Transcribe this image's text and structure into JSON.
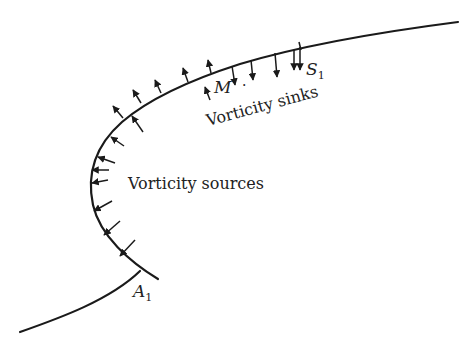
{
  "diagram": {
    "type": "boundary-vorticity-flux",
    "labels": {
      "sources": "Vorticity sources",
      "sinks": "Vorticity sinks",
      "point_m": "M",
      "point_s": "S",
      "point_s_sub": "1",
      "point_a": "A",
      "point_a_sub": "1"
    },
    "colors": {
      "line": "#1a1a1a",
      "text": "#222222",
      "background": "#ffffff"
    },
    "source_arrows_count": 14,
    "sink_arrows_count": 5
  }
}
